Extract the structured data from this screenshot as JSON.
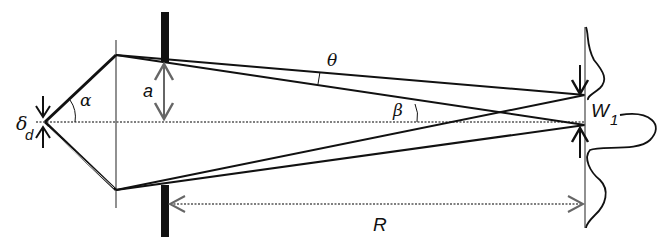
{
  "diagram": {
    "type": "optics-geometry",
    "labels": {
      "alpha": "α",
      "theta": "θ",
      "beta": "β",
      "a": "a",
      "delta": "δ",
      "delta_sub": "d",
      "W": "W",
      "W_sub": "1",
      "R": "R"
    },
    "colors": {
      "line": "#111111",
      "dashed": "#555555",
      "arrow_gray": "#666666"
    }
  }
}
